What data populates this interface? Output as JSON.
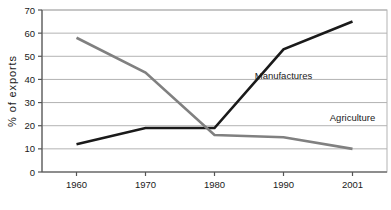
{
  "chart_data": {
    "type": "line",
    "title": "",
    "xlabel": "",
    "ylabel": "% of exports",
    "x": [
      "1960",
      "1970",
      "1980",
      "1990",
      "2001"
    ],
    "categories": [
      "1960",
      "1970",
      "1980",
      "1990",
      "2001"
    ],
    "ylim": [
      0,
      70
    ],
    "yticks": [
      0,
      10,
      20,
      30,
      40,
      50,
      60,
      70
    ],
    "ytick_labels": [
      "0",
      "10",
      "20",
      "30",
      "40",
      "50",
      "60",
      "70"
    ],
    "grid": true,
    "grid_axis": "y",
    "legend_position": "inline-annotation",
    "series": [
      {
        "name": "Manufactures",
        "values": [
          12,
          19,
          19,
          53,
          65
        ],
        "color": "#1a1a1a",
        "label_x": "1990",
        "label_y": 40
      },
      {
        "name": "Agriculture",
        "values": [
          58,
          43,
          16,
          15,
          10
        ],
        "color": "#808080",
        "label_x": "2001",
        "label_y": 22
      }
    ],
    "annotations": [
      {
        "text": "Manufactures",
        "series": "Manufactures"
      },
      {
        "text": "Agriculture",
        "series": "Agriculture"
      }
    ],
    "colors": {
      "manufactures": "#1a1a1a",
      "agriculture": "#808080",
      "gridline": "#b3b3b3",
      "axis": "#555555",
      "background": "#ffffff"
    }
  }
}
